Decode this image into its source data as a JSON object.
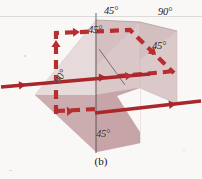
{
  "figure": {
    "caption": "(b)",
    "labels": [
      {
        "id": "top-left-45",
        "text": "45°",
        "x": 104,
        "y": 8,
        "rotated": false
      },
      {
        "id": "top-right-90",
        "text": "90°",
        "x": 158,
        "y": 9,
        "rotated": false
      },
      {
        "id": "inner-45",
        "text": "45°",
        "x": 89,
        "y": 27,
        "rotated": false
      },
      {
        "id": "right-45",
        "text": "45°",
        "x": 152,
        "y": 43,
        "rotated": false
      },
      {
        "id": "left-90",
        "text": "90°",
        "x": 54,
        "y": 82,
        "rotated": true
      },
      {
        "id": "bottom-45",
        "text": "45°",
        "x": 95,
        "y": 130,
        "rotated": false
      }
    ],
    "colors": {
      "ray_solid": "#a81f22",
      "ray_dashed": "#b7282b",
      "face_light": "#e9dddd",
      "face_mid": "#d8c3c5",
      "face_dark": "#c7a3a6",
      "face_right": "#ddcaca",
      "edge_line": "#4a4546",
      "page": "#fdfcfb",
      "text": "#1c1a1a"
    },
    "geometry": {
      "faces": [
        {
          "id": "left-face",
          "points": "35,95 96,20 96,143 35,95",
          "fill": "face_light"
        },
        {
          "id": "upper-left-face",
          "points": "96,20 35,95 96,95 140,22 96,20",
          "fill": "face_mid"
        },
        {
          "id": "center-face",
          "points": "96,20 140,22 140,88 96,95 96,20",
          "fill": "face_mid"
        },
        {
          "id": "right-face",
          "points": "140,22 176,30 176,103 140,88",
          "fill": "face_right"
        },
        {
          "id": "lower-face",
          "points": "96,95 140,88 140,143 96,152",
          "fill": "face_dark"
        },
        {
          "id": "lower-left-face",
          "points": "35,95 96,95 96,152 35,95",
          "fill": "face_dark"
        }
      ],
      "edges": [
        {
          "id": "vertical-edge",
          "path": "M96,14 L96,152"
        },
        {
          "id": "inner-diagonal",
          "path": "M99,48 L124,84"
        }
      ],
      "rays": {
        "solid": [
          {
            "id": "entry-ray",
            "path": "M2,86 L148,73"
          },
          {
            "id": "exit-ray",
            "path": "M96,112 L200,100"
          }
        ],
        "dashed": [
          {
            "id": "folded-ray",
            "path": "M56,112 L56,34 L128,31 L172,72"
          },
          {
            "id": "stub-ray",
            "path": "M56,112 L92,110"
          }
        ],
        "arrowheads": [
          {
            "id": "entry-arrow",
            "x": 22,
            "y": 84,
            "angle": -5,
            "style": "solid"
          },
          {
            "id": "mid-arrow",
            "x": 102,
            "y": 76,
            "angle": -5,
            "style": "solid"
          },
          {
            "id": "exit-arrow",
            "x": 172,
            "y": 103,
            "angle": -7,
            "style": "solid"
          },
          {
            "id": "up-arrow",
            "x": 56,
            "y": 54,
            "angle": -90,
            "style": "dashed"
          },
          {
            "id": "top-arrow",
            "x": 74,
            "y": 33,
            "angle": -2,
            "style": "dashed"
          },
          {
            "id": "diag-arrow",
            "x": 152,
            "y": 52,
            "angle": 43,
            "style": "dashed"
          },
          {
            "id": "stub-arrow",
            "x": 70,
            "y": 111,
            "angle": -3,
            "style": "dashed"
          },
          {
            "id": "return-arrow",
            "x": 126,
            "y": 75,
            "angle": -5,
            "style": "dashed"
          }
        ]
      }
    }
  }
}
